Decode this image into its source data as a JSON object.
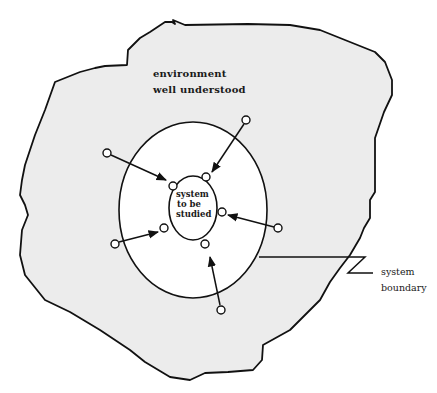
{
  "diagram": {
    "environment_label": [
      "environment",
      "well understood"
    ],
    "system_label": [
      "system",
      "to be",
      "studied"
    ],
    "boundary_label": [
      "system",
      "boundary"
    ],
    "colors": {
      "environment_fill": "#ececec",
      "boundary_fill": "#ffffff",
      "stroke": "#111111",
      "text": "#1a1a1a"
    },
    "shapes": {
      "environment_blob": "irregular outline",
      "boundary_ellipse": {
        "cx": 193,
        "cy": 210,
        "rx": 74,
        "ry": 88
      },
      "system_ellipse": {
        "cx": 193,
        "cy": 208,
        "rx": 24,
        "ry": 32
      }
    },
    "inputs": [
      {
        "from": [
          107,
          153
        ],
        "to": [
          173,
          186
        ],
        "port": "top-left"
      },
      {
        "from": [
          246,
          120
        ],
        "to": [
          206,
          177
        ],
        "port": "top"
      },
      {
        "from": [
          278,
          228
        ],
        "to": [
          222,
          212
        ],
        "port": "right"
      },
      {
        "from": [
          115,
          244
        ],
        "to": [
          163,
          229
        ],
        "port": "left"
      },
      {
        "from": [
          221,
          310
        ],
        "to": [
          207,
          256
        ],
        "port": "bottom"
      }
    ]
  }
}
